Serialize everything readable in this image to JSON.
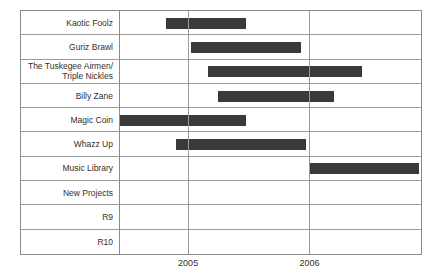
{
  "chart_data": {
    "type": "bar",
    "chart_style": "gantt",
    "title": "",
    "xlabel": "",
    "ylabel": "",
    "grid": true,
    "legend": null,
    "x_axis": {
      "ticks": [
        {
          "label": "2005",
          "value": 2005
        },
        {
          "label": "2006",
          "value": 2006
        }
      ],
      "range_start": 2004.43,
      "range_end": 2006.92
    },
    "categories": [
      "Kaotic Foolz",
      "Guriz Brawl",
      "The Tuskegee Airmen/\nTriple Nickles",
      "Billy Zane",
      "Magic Coin",
      "Whazz Up",
      "Music Library",
      "New Projects",
      "R9",
      "R10"
    ],
    "bars": [
      {
        "category": "Kaotic Foolz",
        "start": 2004.82,
        "end": 2005.48
      },
      {
        "category": "Guriz Brawl",
        "start": 2005.02,
        "end": 2005.93
      },
      {
        "category": "The Tuskegee Airmen/\nTriple Nickles",
        "start": 2005.16,
        "end": 2006.43
      },
      {
        "category": "Billy Zane",
        "start": 2005.25,
        "end": 2006.2
      },
      {
        "category": "Magic Coin",
        "start": 2004.43,
        "end": 2005.48
      },
      {
        "category": "Whazz Up",
        "start": 2004.9,
        "end": 2005.97
      },
      {
        "category": "Music Library",
        "start": 2006.0,
        "end": 2006.9
      },
      {
        "category": "New Projects",
        "start": null,
        "end": null
      },
      {
        "category": "R9",
        "start": null,
        "end": null
      },
      {
        "category": "R10",
        "start": null,
        "end": null
      }
    ],
    "colors": {
      "bar": "#3a3a3a",
      "grid": "#9a9a9a",
      "frame": "#8c8c8c",
      "text": "#2f2f2f",
      "background": "#ffffff"
    }
  }
}
